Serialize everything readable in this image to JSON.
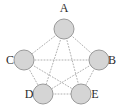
{
  "figure": {
    "title": "",
    "kind": "graph-diagram",
    "width": 120,
    "height": 112,
    "background_color": "#ffffff"
  },
  "style": {
    "node_fill": "#d5d5d5",
    "node_stroke": "#9a9a9a",
    "node_stroke_width": 1,
    "node_radius": 10,
    "edge_color": "#b0b0b0",
    "edge_width": 1,
    "edge_dash": "1,2",
    "label_color": "#2b2b2b",
    "label_font_size": 12
  },
  "graph": {
    "name": "complete-graph-k5",
    "node_count": 5,
    "edge_count": 10,
    "nodes": [
      {
        "id": "A",
        "label": "A",
        "cx": 64,
        "cy": 29,
        "label_x": 64,
        "label_y": 9,
        "label_position": "above"
      },
      {
        "id": "B",
        "label": "B",
        "cx": 99,
        "cy": 60,
        "label_x": 112,
        "label_y": 61,
        "label_position": "right"
      },
      {
        "id": "C",
        "label": "C",
        "cx": 24,
        "cy": 60,
        "label_x": 10,
        "label_y": 61,
        "label_position": "left"
      },
      {
        "id": "D",
        "label": "D",
        "cx": 43,
        "cy": 94,
        "label_x": 29,
        "label_y": 95,
        "label_position": "left"
      },
      {
        "id": "E",
        "label": "E",
        "cx": 81,
        "cy": 94,
        "label_x": 95,
        "label_y": 95,
        "label_position": "right"
      }
    ],
    "edges": [
      {
        "from": "A",
        "to": "B"
      },
      {
        "from": "A",
        "to": "C"
      },
      {
        "from": "A",
        "to": "D"
      },
      {
        "from": "A",
        "to": "E"
      },
      {
        "from": "B",
        "to": "C"
      },
      {
        "from": "B",
        "to": "D"
      },
      {
        "from": "B",
        "to": "E"
      },
      {
        "from": "C",
        "to": "D"
      },
      {
        "from": "C",
        "to": "E"
      },
      {
        "from": "D",
        "to": "E"
      }
    ]
  }
}
